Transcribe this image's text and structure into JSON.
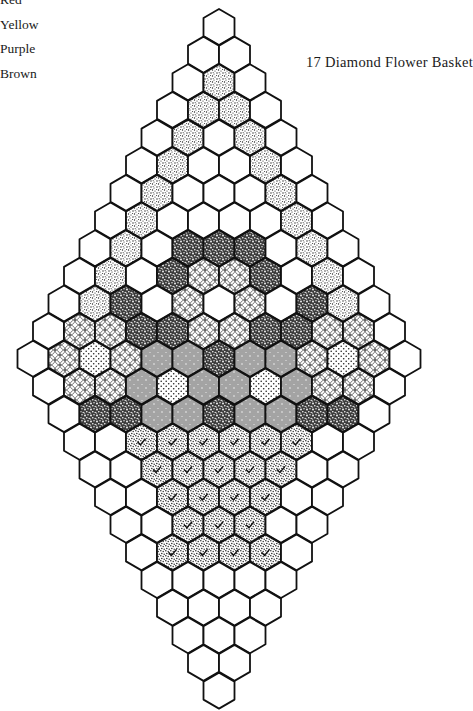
{
  "legend": {
    "items": [
      {
        "label": "Red",
        "pattern": "dark-speckle"
      },
      {
        "label": "Yellow",
        "pattern": "fine-stipple"
      },
      {
        "label": "Purple",
        "pattern": "circle-lace"
      },
      {
        "label": "Brown",
        "pattern": "hatch-dots"
      }
    ]
  },
  "title": "17 Diamond Flower Basket",
  "quilt": {
    "geometry": {
      "center_x": 219,
      "top_center_y": 27,
      "row_step": 27.65,
      "hex_width": 31,
      "hex_height": 36
    },
    "pattern_key": {
      "W": "white",
      "S": "fine-stipple",
      "D": "dark-speckle",
      "C": "circle-lace",
      "P": "polka-dot",
      "H": "hatch-dots",
      "K": "stipple-check"
    },
    "rows": [
      "W",
      "WW",
      "WSW",
      "WSSW",
      "WSWSW",
      "WSWWSW",
      "WSWWWSW",
      "WSWWWWSW",
      "WSWDDDWSW",
      "WSWDCCDWSW",
      "WSDWCWCWDSW",
      "WCCDDCCDDCCW",
      "WCPCHHDHHCPCW",
      "WCCHPHHPHCCW",
      "WDDHHDHHDDW",
      "WWKKKKKKWW",
      "WWKKKKKWW",
      "WWKKKKWW",
      "WWKKKWW",
      "WKKKKW",
      "WWWWW",
      "WWWW",
      "WWW",
      "WW",
      "W"
    ]
  }
}
